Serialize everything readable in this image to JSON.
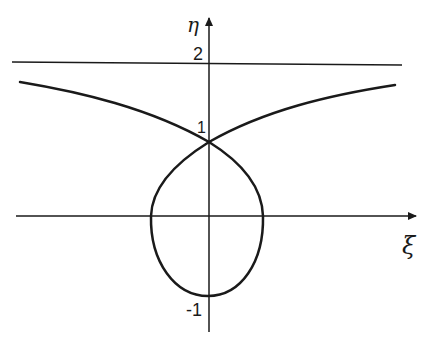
{
  "diagram": {
    "type": "curve-plot",
    "axes": {
      "x_label": "ξ",
      "y_label": "η",
      "tick_labels": {
        "y_2": "2",
        "y_1": "1",
        "y_neg1": "-1"
      }
    },
    "elements": [
      {
        "id": "asymptote",
        "kind": "horizontal line",
        "eta": 2
      },
      {
        "id": "upper-branches",
        "kind": "curve",
        "description": "two branches rising from crossing at (0,1) toward asymptote η=2"
      },
      {
        "id": "loop",
        "kind": "closed teardrop loop",
        "passes_through": [
          [
            0,
            1
          ],
          [
            0,
            -1
          ]
        ]
      }
    ],
    "colors": {
      "stroke": "#1a1a1a",
      "background": "#ffffff"
    }
  }
}
